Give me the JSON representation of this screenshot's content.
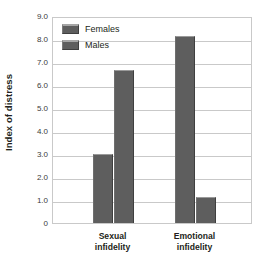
{
  "chart_data": {
    "type": "bar",
    "title": "",
    "subtitle": "",
    "xlabel": "",
    "ylabel": "Index of distress",
    "categories": [
      "Sexual infidelity",
      "Emotional infidelity"
    ],
    "category_lines": [
      {
        "line1": "Sexual",
        "line2": "infidelity"
      },
      {
        "line1": "Emotional",
        "line2": "infidelity"
      }
    ],
    "series": [
      {
        "name": "Females",
        "values": [
          3.0,
          8.15
        ],
        "color": "#5e5e5e"
      },
      {
        "name": "Males",
        "values": [
          6.65,
          1.15
        ],
        "color": "#5e5e5e"
      }
    ],
    "ylim": [
      0,
      9
    ],
    "ytick_values": [
      9,
      8,
      7,
      6,
      5,
      4,
      3,
      2,
      1,
      0
    ],
    "ytick_labels": [
      "9.0",
      "8.0",
      "7.0",
      "6.0",
      "5.0",
      "4.0",
      "3.0",
      "2.0",
      "1.0",
      "0"
    ],
    "grid": true,
    "grid_axis": "y",
    "legend_position": "top-left-inside",
    "legend_entries": [
      "Females",
      "Males"
    ]
  },
  "legend": {
    "items": [
      {
        "label": "Females",
        "swatch_name": "legend-swatch-females"
      },
      {
        "label": "Males",
        "swatch_name": "legend-swatch-males"
      }
    ]
  },
  "axes": {
    "y_title": "Index of distress",
    "y_ticks": [
      "9.0",
      "8.0",
      "7.0",
      "6.0",
      "5.0",
      "4.0",
      "3.0",
      "2.0",
      "1.0",
      "0"
    ]
  },
  "colors": {
    "bar_fill": "#5e5e5e",
    "bar_highlight": "#9a9a9a",
    "bar_shadow": "#3f3f3f",
    "gridline": "#c9c9c9",
    "text": "#231f20",
    "tick_text": "#3b3b3b",
    "background": "#ffffff"
  }
}
